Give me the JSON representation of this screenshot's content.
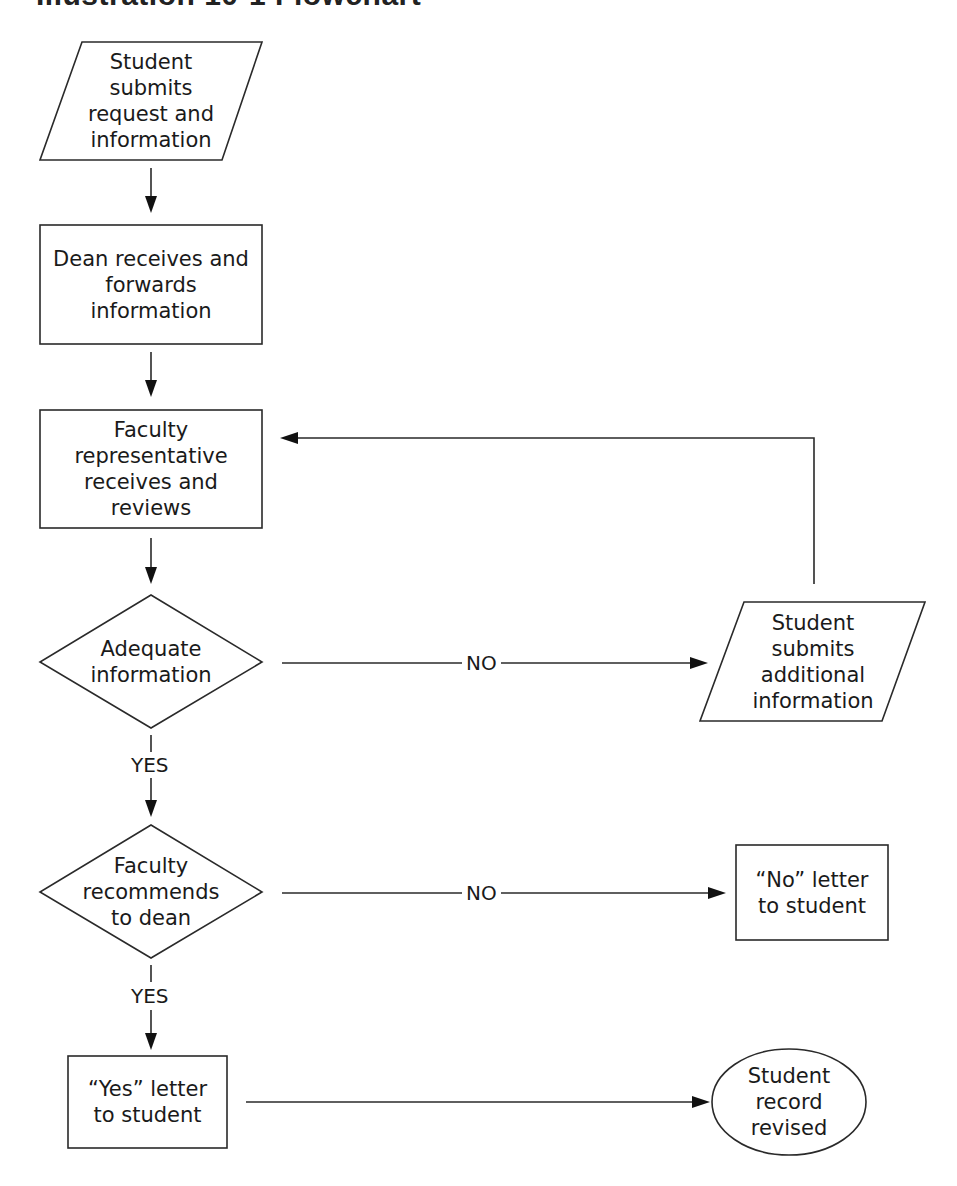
{
  "title": "Illustration 10-1 Flowchart",
  "nodes": {
    "student_submits": {
      "type": "input-output",
      "label": "Student\nsubmits\nrequest and\ninformation"
    },
    "dean_receives": {
      "type": "process",
      "label": "Dean receives and\nforwards\ninformation"
    },
    "faculty_rep_reviews": {
      "type": "process",
      "label": "Faculty\nrepresentative\nreceives and\nreviews"
    },
    "adequate_info": {
      "type": "decision",
      "label": "Adequate\ninformation"
    },
    "student_additional": {
      "type": "input-output",
      "label": "Student\nsubmits\nadditional\ninformation"
    },
    "faculty_recommends": {
      "type": "decision",
      "label": "Faculty\nrecommends\nto dean"
    },
    "no_letter": {
      "type": "process",
      "label": "“No” letter\nto student"
    },
    "yes_letter": {
      "type": "process",
      "label": "“Yes” letter\nto student"
    },
    "record_revised": {
      "type": "terminal",
      "label": "Student\nrecord\nrevised"
    }
  },
  "edges": {
    "adequate_no": {
      "from": "adequate_info",
      "to": "student_additional",
      "label": "NO"
    },
    "adequate_yes": {
      "from": "adequate_info",
      "to": "faculty_recommends",
      "label": "YES"
    },
    "recommends_no": {
      "from": "faculty_recommends",
      "to": "no_letter",
      "label": "NO"
    },
    "recommends_yes": {
      "from": "faculty_recommends",
      "to": "yes_letter",
      "label": "YES"
    },
    "loop_back": {
      "from": "student_additional",
      "to": "faculty_rep_reviews",
      "label": ""
    },
    "yes_to_record": {
      "from": "yes_letter",
      "to": "record_revised",
      "label": ""
    }
  }
}
